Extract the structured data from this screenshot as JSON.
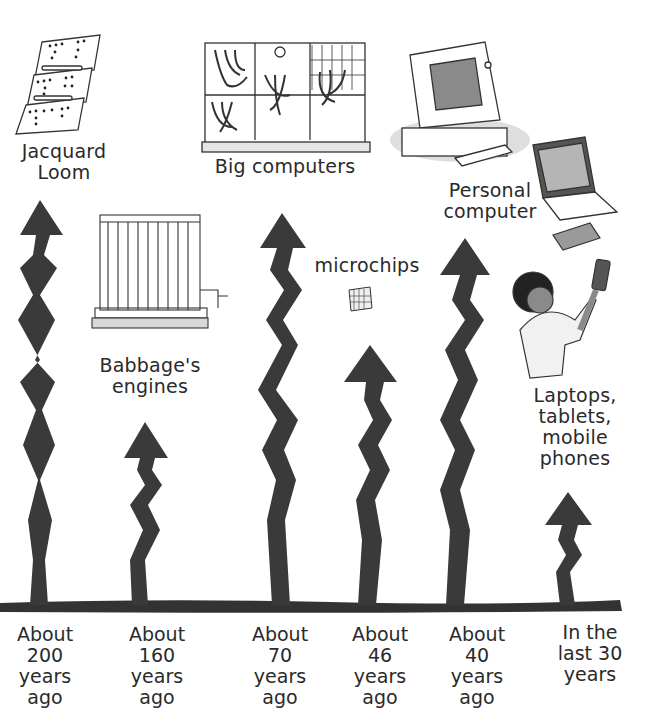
{
  "colors": {
    "ink": "#2f2f2f",
    "arrow": "#3a3a3a",
    "paper": "#ffffff",
    "shade": "#bdbdbd"
  },
  "inventions": [
    {
      "id": "jacquard",
      "lines": [
        "Jacquard",
        "Loom"
      ],
      "icon": "punch-card-icon"
    },
    {
      "id": "babbage",
      "lines": [
        "Babbage's",
        "engines"
      ],
      "icon": "difference-engine-icon"
    },
    {
      "id": "big",
      "lines": [
        "Big computers"
      ],
      "icon": "mainframe-icon"
    },
    {
      "id": "microchips",
      "lines": [
        "microchips"
      ],
      "icon": "microchip-icon"
    },
    {
      "id": "pc",
      "lines": [
        "Personal",
        "computer"
      ],
      "icon": "desktop-computer-icon"
    },
    {
      "id": "mobile",
      "lines": [
        "Laptops,",
        "tablets,",
        "mobile",
        "phones"
      ],
      "icon": "person-with-phone-icon"
    }
  ],
  "timeline": [
    {
      "lines": [
        "About",
        "200",
        "years",
        "ago"
      ]
    },
    {
      "lines": [
        "About",
        "160",
        "years",
        "ago"
      ]
    },
    {
      "lines": [
        "About",
        "70",
        "years",
        "ago"
      ]
    },
    {
      "lines": [
        "About",
        "46",
        "years",
        "ago"
      ]
    },
    {
      "lines": [
        "About",
        "40",
        "years",
        "ago"
      ]
    },
    {
      "lines": [
        "In the",
        "last 30",
        "years"
      ]
    }
  ]
}
